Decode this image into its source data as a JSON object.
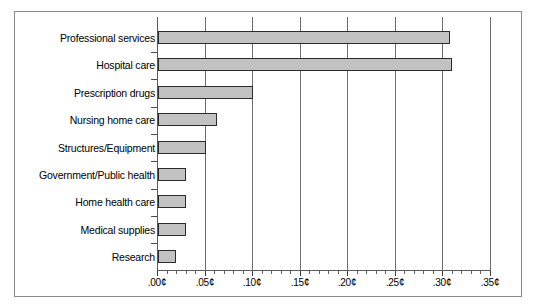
{
  "chart_data": {
    "type": "bar",
    "orientation": "horizontal",
    "title": "",
    "subtitle": "",
    "xlabel": "",
    "ylabel": "",
    "categories": [
      "Professional services",
      "Hospital care",
      "Prescription drugs",
      "Nursing home care",
      "Structures/Equipment",
      "Government/Public health",
      "Home health care",
      "Medical supplies",
      "Research"
    ],
    "values": [
      0.307,
      0.309,
      0.1,
      0.062,
      0.05,
      0.029,
      0.029,
      0.029,
      0.019
    ],
    "value_unit": "cents",
    "xlim": [
      0.0,
      0.35
    ],
    "xtick_values": [
      0.0,
      0.05,
      0.1,
      0.15,
      0.2,
      0.25,
      0.3,
      0.35
    ],
    "xtick_labels": [
      ".00¢",
      ".05¢",
      ".10¢",
      ".15¢",
      ".20¢",
      ".25¢",
      ".30¢",
      ".35¢"
    ],
    "minor_ticks_per_interval": 5,
    "grid": "vertical",
    "legend": null,
    "legend_position": "none",
    "bar_fill_color": "#c2c2c2",
    "bar_border_color": "#2b2b2b",
    "axis_color": "#5a5a5a",
    "grid_color": "#6e6e6e",
    "background_color": "#ffffff",
    "frame_color": "#8a8a8a"
  }
}
